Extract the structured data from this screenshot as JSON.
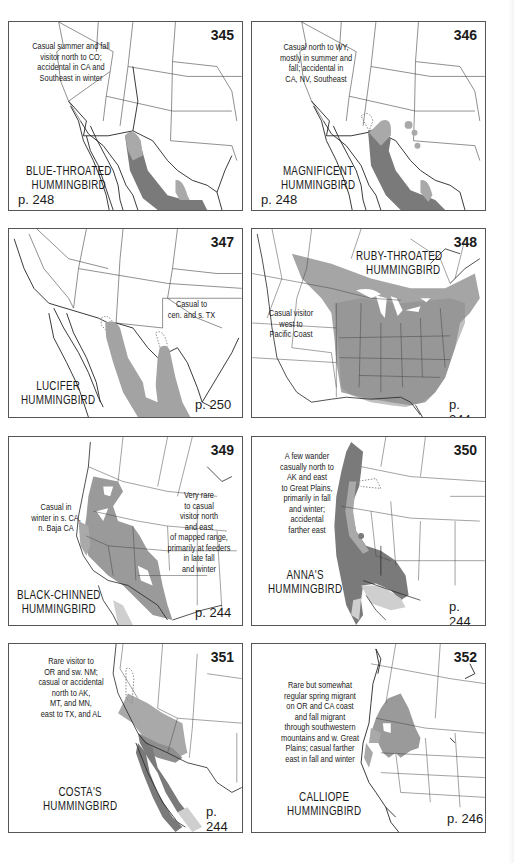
{
  "colors": {
    "range_dark": "#7a7a7a",
    "range_light": "#a9a9a9",
    "range_pale": "#cfcfcf",
    "border": "#555555",
    "lines": "#333333"
  },
  "panels": [
    {
      "number": "345",
      "name_lines": [
        "BLUE-THROATED",
        "HUMMINGBIRD"
      ],
      "page": "p. 248",
      "note_lines": [
        "Casual summer and fall",
        "visitor north to CO;",
        "accidental in CA and",
        "Southeast in winter"
      ]
    },
    {
      "number": "346",
      "name_lines": [
        "MAGNIFICENT",
        "HUMMINGBIRD"
      ],
      "page": "p. 248",
      "note_lines": [
        "Casual north to WY,",
        "mostly in summer and",
        "fall; accidental in",
        "CA, NV, Southeast"
      ]
    },
    {
      "number": "347",
      "name_lines": [
        "LUCIFER",
        "HUMMINGBIRD"
      ],
      "page": "p. 250",
      "note_lines": [
        "Casual to",
        "cen. and s. TX"
      ]
    },
    {
      "number": "348",
      "name_lines": [
        "RUBY-THROATED",
        "HUMMINGBIRD"
      ],
      "page": "p. 244",
      "note_lines": [
        "Casual visitor",
        "west to",
        "Pacific Coast"
      ]
    },
    {
      "number": "349",
      "name_lines": [
        "BLACK-CHINNED",
        "HUMMINGBIRD"
      ],
      "page": "p. 244",
      "note_lines": [
        "Casual in",
        "winter in s. CA,",
        "n. Baja CA"
      ],
      "note2_lines": [
        "Very rare",
        "to casual",
        "visitor north",
        "and east",
        "of mapped range,",
        "primarily at feeders",
        "in late fall",
        "and winter"
      ]
    },
    {
      "number": "350",
      "name_lines": [
        "ANNA'S",
        "HUMMINGBIRD"
      ],
      "page": "p. 244",
      "note_lines": [
        "A few wander",
        "casually north to",
        "AK and east",
        "to Great Plains,",
        "primarily in fall",
        "and winter;",
        "accidental",
        "farther east"
      ]
    },
    {
      "number": "351",
      "name_lines": [
        "COSTA'S",
        "HUMMINGBIRD"
      ],
      "page": "p. 244",
      "note_lines": [
        "Rare visitor to",
        "OR and sw. NM;",
        "casual or accidental",
        "north to AK,",
        "MT, and MN,",
        "east to TX, and AL"
      ]
    },
    {
      "number": "352",
      "name_lines": [
        "CALLIOPE",
        "HUMMINGBIRD"
      ],
      "page": "p. 246",
      "note_lines": [
        "Rare but somewhat",
        "regular spring migrant",
        "on OR and CA coast",
        "and fall migrant",
        "through southwestern",
        "mountains and w. Great",
        "Plains; casual farther",
        "east in fall and winter"
      ]
    }
  ]
}
